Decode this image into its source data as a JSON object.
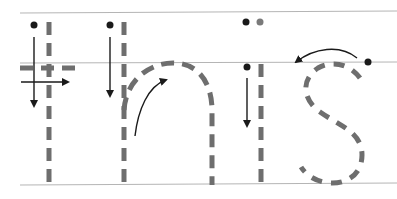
{
  "worksheet": {
    "word": "this",
    "letters": [
      "t",
      "h",
      "i",
      "s"
    ],
    "colors": {
      "guide_line": "#b5b5b5",
      "dashed_stroke": "#6e6e6e",
      "arrow": "#1a1a1a",
      "start_dot": "#1a1a1a",
      "secondary_dot": "#7a7a7a",
      "background": "#ffffff"
    }
  }
}
